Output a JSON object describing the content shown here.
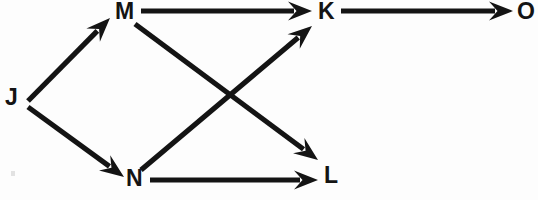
{
  "diagram": {
    "type": "directed-graph",
    "background_color": "#fdfdfd",
    "stroke_color": "#141414",
    "canvas": {
      "width": 538,
      "height": 200
    },
    "nodes": [
      {
        "id": "J",
        "label": "J",
        "x": 5,
        "y": 86
      },
      {
        "id": "M",
        "label": "M",
        "x": 115,
        "y": 0
      },
      {
        "id": "N",
        "label": "N",
        "x": 126,
        "y": 167
      },
      {
        "id": "K",
        "label": "K",
        "x": 318,
        "y": 0
      },
      {
        "id": "L",
        "label": "L",
        "x": 324,
        "y": 164
      },
      {
        "id": "O",
        "label": "O",
        "x": 517,
        "y": 0
      }
    ],
    "edges": [
      {
        "from": "J",
        "to": "M",
        "x1": 28,
        "y1": 101,
        "x2": 110,
        "y2": 18
      },
      {
        "from": "J",
        "to": "N",
        "x1": 28,
        "y1": 107,
        "x2": 124,
        "y2": 177
      },
      {
        "from": "M",
        "to": "K",
        "x1": 141,
        "y1": 11,
        "x2": 312,
        "y2": 11
      },
      {
        "from": "M",
        "to": "L",
        "x1": 135,
        "y1": 24,
        "x2": 318,
        "y2": 160
      },
      {
        "from": "N",
        "to": "K",
        "x1": 141,
        "y1": 170,
        "x2": 312,
        "y2": 26
      },
      {
        "from": "N",
        "to": "L",
        "x1": 150,
        "y1": 180,
        "x2": 318,
        "y2": 180
      },
      {
        "from": "K",
        "to": "O",
        "x1": 341,
        "y1": 11,
        "x2": 513,
        "y2": 11
      }
    ]
  }
}
